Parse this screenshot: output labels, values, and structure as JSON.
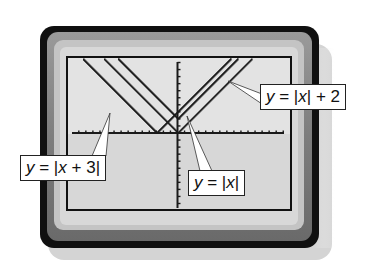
{
  "figure": {
    "colors": {
      "bezel_outer": "#111111",
      "bezel_band": "#8a8a8a",
      "bezel_inner": "#c9c9c9",
      "screen_bg": "#e4e4e4",
      "screen_lower_bg": "#d6d6d6",
      "plot_ink": "#1a1a1a",
      "label_bg": "#ffffff"
    }
  },
  "window": {
    "xmin": -15,
    "xmax": 15,
    "ymin": -10,
    "ymax": 10,
    "xscl": 1,
    "yscl": 1
  },
  "chart_data": {
    "type": "line",
    "title": "",
    "xlabel": "",
    "ylabel": "",
    "xlim": [
      -15,
      15
    ],
    "ylim": [
      -10,
      10
    ],
    "grid": false,
    "series": [
      {
        "name": "y = |x + 3|",
        "expr": "abs(x+3)",
        "vertex": [
          -3,
          0
        ]
      },
      {
        "name": "y = |x|",
        "expr": "abs(x)",
        "vertex": [
          0,
          0
        ]
      },
      {
        "name": "y = |x| + 2",
        "expr": "abs(x)+2",
        "vertex": [
          0,
          2
        ]
      }
    ]
  },
  "labels": {
    "shifted_left": {
      "prefix": "y",
      "eq": " = |",
      "var": "x",
      "rest": " + 3|"
    },
    "parent": {
      "prefix": "y",
      "eq": " = |",
      "var": "x",
      "rest": "|"
    },
    "shifted_up": {
      "prefix": "y",
      "eq": " = |",
      "var": "x",
      "rest": "| + 2"
    }
  }
}
